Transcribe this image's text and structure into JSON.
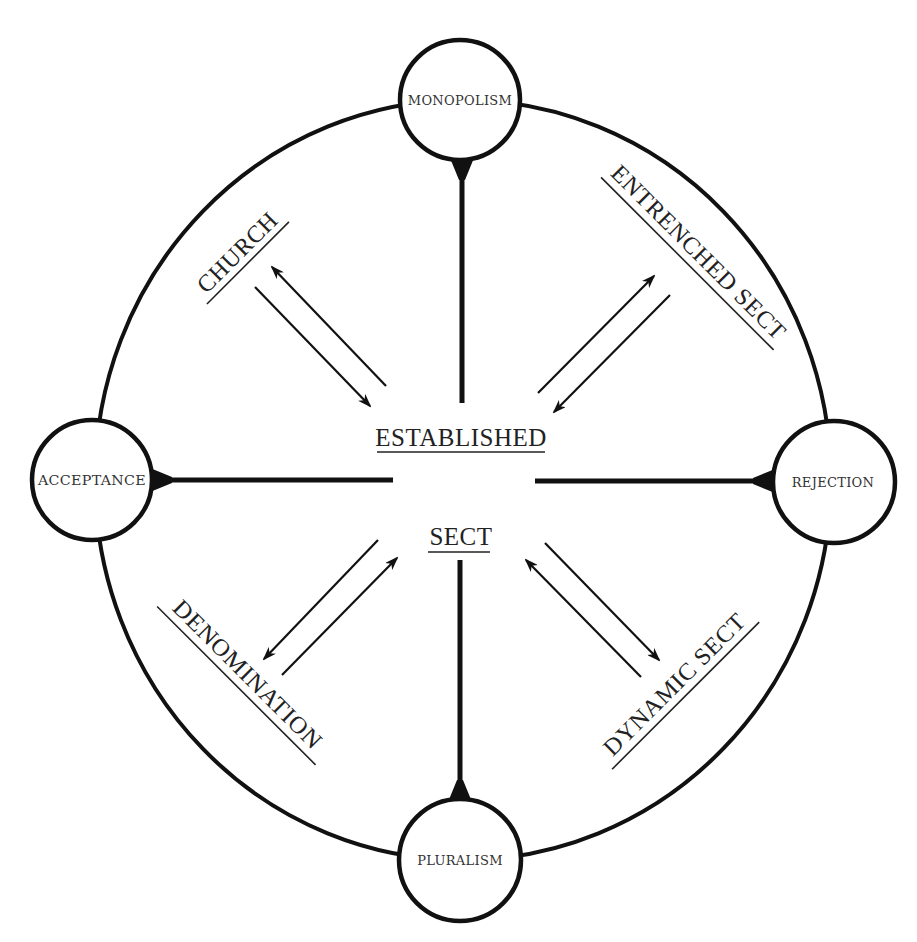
{
  "diagram": {
    "center": {
      "top_label": "ESTABLISHED",
      "bottom_label": "SECT"
    },
    "poles": [
      {
        "id": "top",
        "label": "MONOPOLISM"
      },
      {
        "id": "left",
        "label": "ACCEPTANCE"
      },
      {
        "id": "right",
        "label": "REJECTION"
      },
      {
        "id": "bottom",
        "label": "PLURALISM"
      }
    ],
    "quadrants": [
      {
        "id": "nw",
        "label": "CHURCH"
      },
      {
        "id": "ne",
        "label": "ENTRENCHED SECT"
      },
      {
        "id": "sw",
        "label": "DENOMINATION"
      },
      {
        "id": "se",
        "label": "DYNAMIC SECT"
      }
    ],
    "colors": {
      "stroke": "#111111",
      "text": "#222222",
      "background": "#ffffff"
    }
  }
}
